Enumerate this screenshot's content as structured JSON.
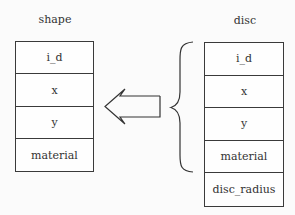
{
  "diagram": {
    "left_entity": {
      "title": "shape",
      "fields": [
        "i_d",
        "x",
        "y",
        "material"
      ]
    },
    "right_entity": {
      "title": "disc",
      "fields": [
        "i_d",
        "x",
        "y",
        "material",
        "disc_radius"
      ]
    },
    "relation": {
      "type": "inheritance",
      "arrow_direction": "left",
      "brace_groups_fields": [
        "i_d",
        "x",
        "y",
        "material"
      ],
      "description": "disc inherits fields i_d, x, y, material from shape"
    }
  }
}
